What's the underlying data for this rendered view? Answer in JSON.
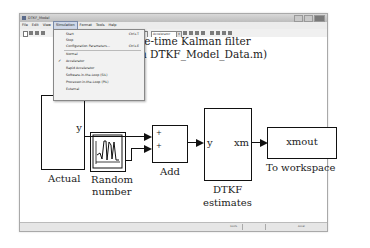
{
  "window": {
    "title": "DTKF_Model"
  },
  "menubar": {
    "items": [
      {
        "label": "File"
      },
      {
        "label": "Edit"
      },
      {
        "label": "View"
      },
      {
        "label": "Simulation",
        "active": true
      },
      {
        "label": "Format"
      },
      {
        "label": "Tools"
      },
      {
        "label": "Help"
      }
    ]
  },
  "toolbar": {
    "stop_time": "10.0",
    "sim_mode": "Accelerator"
  },
  "simulation_menu": {
    "items": [
      {
        "label": "Start",
        "shortcut": "Ctrl+T"
      },
      {
        "label": "Stop",
        "shortcut": ""
      },
      {
        "label": "Configuration Parameters...",
        "shortcut": "Ctrl+E"
      },
      {
        "label": "Normal",
        "shortcut": ""
      },
      {
        "label": "Accelerator",
        "shortcut": "",
        "checked": true
      },
      {
        "label": "Rapid Accelerator",
        "shortcut": ""
      },
      {
        "label": "Software-in-the-Loop (SIL)",
        "shortcut": ""
      },
      {
        "label": "Processor-in-the-Loop (PIL)",
        "shortcut": ""
      },
      {
        "label": "External",
        "shortcut": ""
      }
    ],
    "check_mark": "✓"
  },
  "diagram": {
    "title_line1": "te-time Kalman filter",
    "title_line2": "h DTKF_Model_Data.m)",
    "actual": {
      "port": "y",
      "label": "Actual"
    },
    "random": {
      "label_line1": "Random",
      "label_line2": "number"
    },
    "add": {
      "plus1": "+",
      "plus2": "+",
      "label": "Add"
    },
    "dtkf": {
      "in_port": "y",
      "out_port": "xm",
      "label_line1": "DTKF",
      "label_line2": "estimates"
    },
    "workspace": {
      "var": "xmout",
      "label": "To workspace"
    }
  },
  "statusbar": {
    "zoom": "100%",
    "solver": "Accel"
  }
}
